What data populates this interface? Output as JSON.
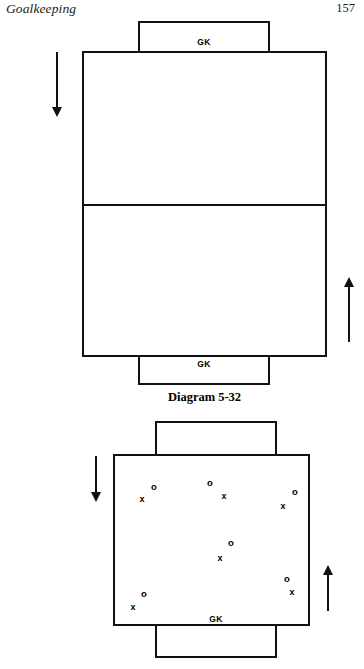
{
  "header": {
    "running_head": "Goalkeeping",
    "page_number": "157"
  },
  "figures": [
    {
      "id": "diagram-5-32",
      "caption": "Diagram 5-32",
      "top_goal_label": "GK",
      "bottom_goal_label": "GK",
      "arrows": [
        {
          "name": "left-down-arrow",
          "direction": "down"
        },
        {
          "name": "right-up-arrow",
          "direction": "up"
        }
      ],
      "has_midline": true,
      "markers": []
    },
    {
      "id": "diagram-5-33",
      "caption": "",
      "top_goal_label": "GK",
      "bottom_goal_label": "GK",
      "arrows": [
        {
          "name": "left-down-arrow",
          "direction": "down"
        },
        {
          "name": "right-up-arrow",
          "direction": "up"
        }
      ],
      "has_midline": false,
      "markers": [
        {
          "symbol": "o",
          "x": 154,
          "y": 487
        },
        {
          "symbol": "x",
          "x": 142,
          "y": 499
        },
        {
          "symbol": "o",
          "x": 210,
          "y": 483
        },
        {
          "symbol": "x",
          "x": 224,
          "y": 496
        },
        {
          "symbol": "o",
          "x": 295,
          "y": 492
        },
        {
          "symbol": "x",
          "x": 283,
          "y": 506
        },
        {
          "symbol": "o",
          "x": 231,
          "y": 543
        },
        {
          "symbol": "x",
          "x": 220,
          "y": 558
        },
        {
          "symbol": "o",
          "x": 144,
          "y": 594
        },
        {
          "symbol": "x",
          "x": 133,
          "y": 607
        },
        {
          "symbol": "o",
          "x": 287,
          "y": 579
        },
        {
          "symbol": "x",
          "x": 292,
          "y": 592
        }
      ]
    }
  ]
}
